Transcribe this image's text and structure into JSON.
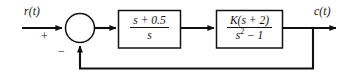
{
  "diagram": {
    "type": "control-system-block-diagram",
    "line_color": "#111111",
    "background_color": "#ffffff",
    "input": {
      "label": "r(t)",
      "sign_at_summing_junction": "+"
    },
    "output": {
      "label": "c(t)"
    },
    "summing_junction": {
      "name": "summing-junction",
      "shape": "circle",
      "input_sign": "+",
      "feedback_sign": "−"
    },
    "blocks": [
      {
        "name": "controller-block",
        "numerator": "s + 0.5",
        "denominator": "s"
      },
      {
        "name": "plant-block",
        "numerator": "K(s + 2)",
        "denominator_prefix": "s",
        "denominator_exponent": "2",
        "denominator_suffix": " − 1"
      }
    ],
    "feedback": {
      "name": "feedback-path",
      "type": "unity",
      "direction": "right-to-left"
    }
  }
}
